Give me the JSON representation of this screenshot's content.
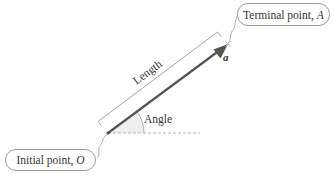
{
  "diagram": {
    "type": "vector-anatomy",
    "terminal_callout": {
      "text": "Terminal point,",
      "var": "A"
    },
    "initial_callout": {
      "text": "Initial point,",
      "var": "O"
    },
    "length_label": "Length",
    "angle_label": "Angle",
    "vector_name": "a",
    "colors": {
      "vector": "#555555",
      "bracket": "#9a9a9a",
      "baseline_dash": "#b5b5b5",
      "angle_fill": "#eeeeee",
      "callout_border": "#9a9a9a",
      "text": "#333333"
    }
  }
}
